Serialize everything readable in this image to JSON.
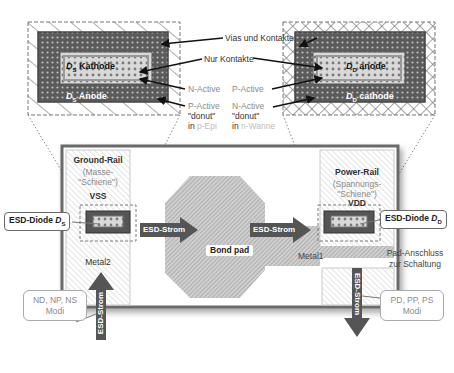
{
  "diagram": {
    "top_labels": {
      "vias_und_kontakte": "Vias und Kontakte",
      "nur_kontakte": "Nur Kontakte",
      "n_active_left": "N-Active",
      "p_active_left": "P-Active",
      "donut_left": "\"donut\"",
      "in_left": "in",
      "well_left": "p-Epi",
      "p_active_right": "P-Active",
      "n_active_right": "N-Active",
      "donut_right": "\"donut\"",
      "in_right": "in",
      "well_right": "n-Wanne"
    },
    "left_detail": {
      "kathode_sym": "D",
      "kathode_sub": "S",
      "kathode_label": "Kathode",
      "anode_sym": "D",
      "anode_sub": "S",
      "anode_label": "Anode"
    },
    "right_detail": {
      "anode_sym": "D",
      "anode_sub": "D",
      "anode_label": "anode",
      "cathode_sym": "D",
      "cathode_sub": "D",
      "cathode_label": "cathode"
    },
    "ground_rail": {
      "title": "Ground-Rail",
      "sub1": "(Masse-",
      "sub2": "\"Schiene\")",
      "net": "VSS",
      "metal": "Metal2"
    },
    "power_rail": {
      "title": "Power-Rail",
      "sub1": "(Spannungs-",
      "sub2": "\"Schiene\")",
      "net": "VDD"
    },
    "diode_left_callout": {
      "text": "ESD-Diode ",
      "sym": "D",
      "sub": "S"
    },
    "diode_right_callout": {
      "text": "ESD-Diode ",
      "sym": "D",
      "sub": "D"
    },
    "arrows": {
      "left_h": "ESD-Strom",
      "right_h": "ESD-Strom",
      "left_v": "ESD-Strom",
      "right_v": "ESD-Strom"
    },
    "bond_pad": "Bond pad",
    "metal1": "Metal1",
    "pad_anschluss_1": "Pad-Anschluss",
    "pad_anschluss_2": "zur Schaltung",
    "modes_left": {
      "line1": "ND, NP, NS",
      "line2": "Modi"
    },
    "modes_right": {
      "line1": "PD, PP, PS",
      "line2": "Modi"
    },
    "colors": {
      "dark_fill": "#5a5a5a",
      "arrow_fill": "#555555",
      "outline": "#6e6e6e",
      "hatch": "#9a9a9a",
      "light_text": "#8a8a8a"
    }
  }
}
